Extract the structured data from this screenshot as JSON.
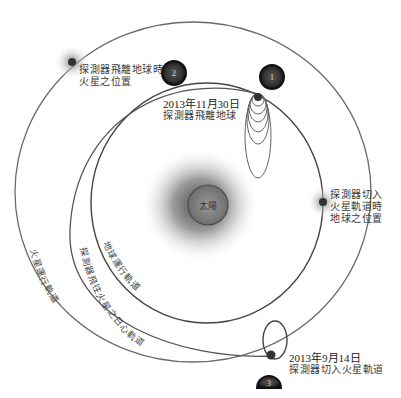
{
  "diagram": {
    "sun": {
      "label": "太陽"
    },
    "orbits": {
      "mars": {
        "label": "火星運行軌道"
      },
      "earth": {
        "label": "地球運行軌道"
      },
      "transfer": {
        "label": "探測器飛往火星之日心軌道"
      }
    },
    "badges": [
      {
        "id": "1",
        "label": "1"
      },
      {
        "id": "2",
        "label": "2"
      },
      {
        "id": "3",
        "label": "3"
      }
    ],
    "annotations": {
      "mars_at_departure": {
        "line1": "探測器飛離地球時",
        "line2": "火星之位置"
      },
      "departure": {
        "date": "2013年11月30日",
        "text": "探測器飛離地球"
      },
      "earth_at_arrival": {
        "line1": "探測器切入",
        "line2": "火星軌道時",
        "line3": "地球之位置"
      },
      "arrival": {
        "date": "2013年9月14日",
        "text": "探測器切入火星軌道"
      }
    },
    "colors": {
      "orbit_line": "#555555",
      "badge_fill": "#2a2a2a",
      "badge_ring": "#111111",
      "text": "#3a3a3a",
      "background": "#ffffff"
    }
  }
}
